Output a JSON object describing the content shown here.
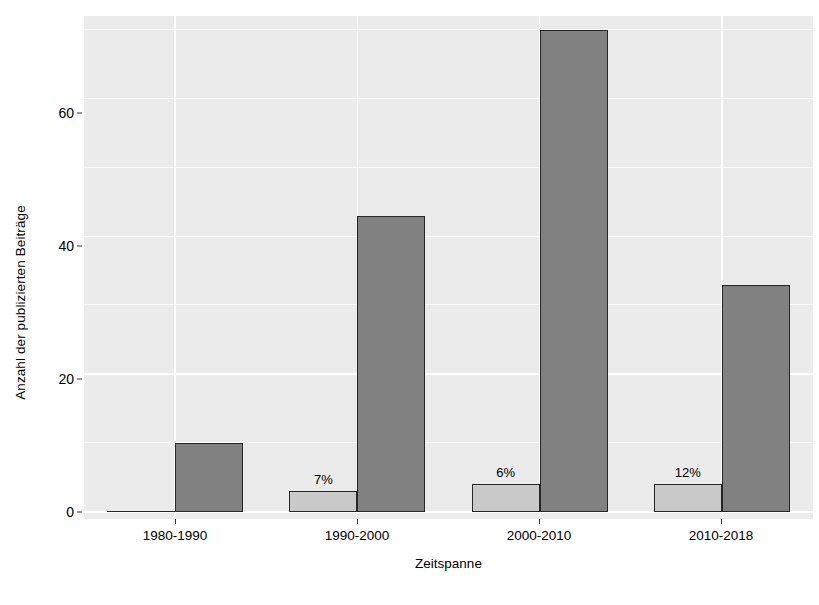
{
  "chart_data": {
    "type": "bar",
    "title": "",
    "xlabel": "Zeitspanne",
    "ylabel": "Anzahl der publizierten Beiträge",
    "categories": [
      "1980-1990",
      "1990-2000",
      "2000-2010",
      "2010-2018"
    ],
    "series": [
      {
        "name": "light",
        "color": "#c9c9c9",
        "values": [
          0,
          3,
          4,
          4
        ],
        "point_labels": [
          "",
          "7%",
          "6%",
          "12%"
        ]
      },
      {
        "name": "dark",
        "color": "#818181",
        "values": [
          10,
          43,
          70,
          33
        ],
        "point_labels": [
          "",
          "",
          "",
          ""
        ]
      }
    ],
    "ylim": [
      0,
      72
    ],
    "yticks": [
      0,
      20,
      40,
      60
    ],
    "ytick_labels": [
      "0",
      "20",
      "40",
      "60"
    ],
    "y_minor_ticks": [
      10,
      30,
      50,
      70
    ],
    "grid": true,
    "grid_color": "#ffffff",
    "panel_background": "#ebebeb",
    "legend": "none"
  },
  "axis": {
    "y_title": "Anzahl der publizierten Beiträge",
    "x_title": "Zeitspanne",
    "y_tick_0": "0",
    "y_tick_1": "20",
    "y_tick_2": "40",
    "y_tick_3": "60",
    "x_tick_0": "1980-1990",
    "x_tick_1": "1990-2000",
    "x_tick_2": "2000-2010",
    "x_tick_3": "2010-2018"
  },
  "annotations": {
    "label_1990_2000": "7%",
    "label_2000_2010": "6%",
    "label_2010_2018": "12%"
  }
}
